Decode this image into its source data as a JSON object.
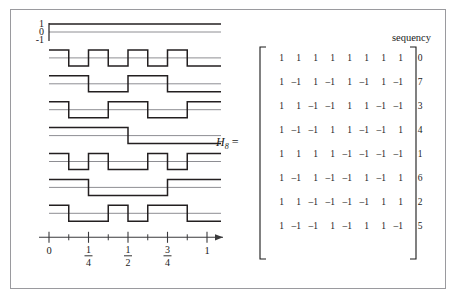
{
  "page": {
    "top_text_remnant": " ",
    "background": "#ffffff",
    "border_color": "#9a9a9e"
  },
  "figure": {
    "matrix_label": "H",
    "matrix_label_sub": "8",
    "matrix_label_eq": "=",
    "sequency_header": "sequency",
    "colors": {
      "waveform": "#231f20",
      "zero_line": "#8e8e93",
      "axis": "#3a3a3c",
      "text": "#1a1a1a",
      "bracket": "#1a1a1a"
    }
  },
  "plot": {
    "y_axis_labels": [
      "1",
      "0",
      "-1"
    ],
    "x_axis": {
      "major_tick_labels": [
        "0",
        "1/4",
        "1/2",
        "3/4",
        "1"
      ],
      "major_tick_values": [
        0,
        0.25,
        0.5,
        0.75,
        1
      ],
      "minor_tick_values": [
        0.125,
        0.375,
        0.625,
        0.875
      ],
      "has_arrow_head": true
    }
  },
  "chart_data": {
    "type": "line",
    "title": "",
    "subtitle": "",
    "xlabel": "",
    "ylabel": "",
    "xlim": [
      0,
      1
    ],
    "ylim": [
      -1,
      1
    ],
    "grid": false,
    "legend": "none",
    "x_segment_edges": [
      0,
      0.125,
      0.25,
      0.375,
      0.5,
      0.625,
      0.75,
      0.875,
      1
    ],
    "series": [
      {
        "name": "row-1",
        "sequency": 0,
        "values": [
          1,
          1,
          1,
          1,
          1,
          1,
          1,
          1
        ]
      },
      {
        "name": "row-2",
        "sequency": 7,
        "values": [
          1,
          -1,
          1,
          -1,
          1,
          -1,
          1,
          -1
        ]
      },
      {
        "name": "row-3",
        "sequency": 3,
        "values": [
          1,
          1,
          -1,
          -1,
          1,
          1,
          -1,
          -1
        ]
      },
      {
        "name": "row-4",
        "sequency": 4,
        "values": [
          1,
          -1,
          -1,
          1,
          1,
          -1,
          -1,
          1
        ]
      },
      {
        "name": "row-5",
        "sequency": 1,
        "values": [
          1,
          1,
          1,
          1,
          -1,
          -1,
          -1,
          -1
        ]
      },
      {
        "name": "row-6",
        "sequency": 6,
        "values": [
          1,
          -1,
          1,
          -1,
          -1,
          1,
          -1,
          1
        ]
      },
      {
        "name": "row-7",
        "sequency": 2,
        "values": [
          1,
          1,
          -1,
          -1,
          -1,
          -1,
          1,
          1
        ]
      },
      {
        "name": "row-8",
        "sequency": 5,
        "values": [
          1,
          -1,
          -1,
          1,
          -1,
          1,
          1,
          -1
        ]
      }
    ]
  },
  "matrix": {
    "name": "H8",
    "rows": [
      {
        "cells": [
          "1",
          "1",
          "1",
          "1",
          "1",
          "1",
          "1",
          "1"
        ],
        "sequency": "0"
      },
      {
        "cells": [
          "1",
          "–1",
          "1",
          "–1",
          "1",
          "–1",
          "1",
          "–1"
        ],
        "sequency": "7"
      },
      {
        "cells": [
          "1",
          "1",
          "–1",
          "–1",
          "1",
          "1",
          "–1",
          "–1"
        ],
        "sequency": "3"
      },
      {
        "cells": [
          "1",
          "–1",
          "–1",
          "1",
          "1",
          "–1",
          "–1",
          "1"
        ],
        "sequency": "4"
      },
      {
        "cells": [
          "1",
          "1",
          "1",
          "1",
          "–1",
          "–1",
          "–1",
          "–1"
        ],
        "sequency": "1"
      },
      {
        "cells": [
          "1",
          "–1",
          "1",
          "–1",
          "–1",
          "1",
          "–1",
          "1"
        ],
        "sequency": "6"
      },
      {
        "cells": [
          "1",
          "1",
          "–1",
          "–1",
          "–1",
          "–1",
          "1",
          "1"
        ],
        "sequency": "2"
      },
      {
        "cells": [
          "1",
          "–1",
          "–1",
          "1",
          "–1",
          "1",
          "1",
          "–1"
        ],
        "sequency": "5"
      }
    ]
  }
}
